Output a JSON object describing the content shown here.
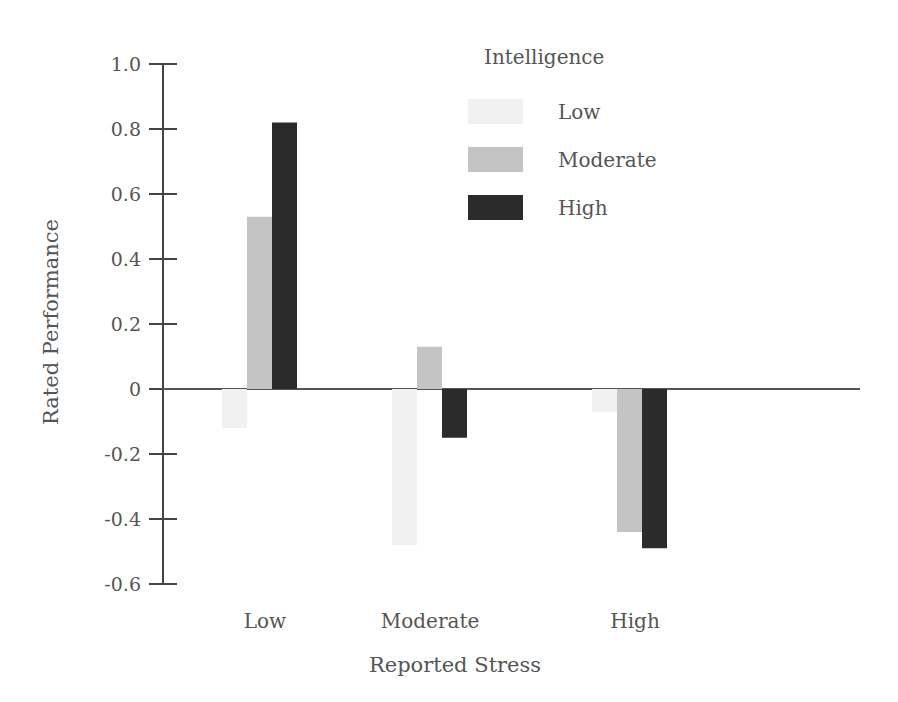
{
  "chart_data": {
    "type": "bar",
    "title": "",
    "xlabel": "Reported Stress",
    "ylabel": "Rated Performance",
    "categories": [
      "Low",
      "Moderate",
      "High"
    ],
    "legend_title": "Intelligence",
    "series": [
      {
        "name": "Low",
        "values": [
          -0.12,
          -0.48,
          -0.07
        ],
        "color": "#f1f1f1"
      },
      {
        "name": "Moderate",
        "values": [
          0.53,
          0.13,
          -0.44
        ],
        "color": "#c4c4c4"
      },
      {
        "name": "High",
        "values": [
          0.82,
          -0.15,
          -0.49
        ],
        "color": "#2b2b2b"
      }
    ],
    "yticks": [
      1.0,
      0.8,
      0.6,
      0.4,
      0.2,
      0,
      -0.2,
      -0.4,
      -0.6
    ],
    "ytick_labels": [
      "1.0",
      "0.8",
      "0.6",
      "0.4",
      "0.2",
      "0",
      "-0.2",
      "-0.4",
      "-0.6"
    ],
    "ylim": [
      -0.6,
      1.0
    ],
    "grid": false,
    "legend_position": "upper right"
  }
}
